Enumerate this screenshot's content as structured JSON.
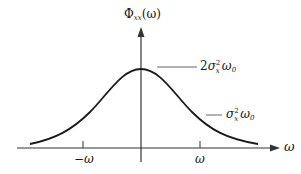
{
  "diagram": {
    "y_axis_label": {
      "symbol": "Φ",
      "subscript": "xx",
      "argument": "(ω)"
    },
    "x_axis_label": "ω",
    "ticks": [
      {
        "label": "−ω",
        "x": 83
      },
      {
        "label": "ω",
        "x": 200
      }
    ],
    "annotations": [
      {
        "id": "peak",
        "coeff": "2",
        "sigma": "σ",
        "sigma_sub": "x",
        "sigma_sup": "2",
        "omega": "ω",
        "omega_sub": "0"
      },
      {
        "id": "half",
        "coeff": "",
        "sigma": "σ",
        "sigma_sub": "x",
        "sigma_sup": "2",
        "omega": "ω",
        "omega_sub": "0"
      }
    ],
    "colors": {
      "axis": "#333333",
      "curve": "#1a1a1a",
      "text": "#1a1a1a",
      "background": "#ffffff"
    }
  }
}
